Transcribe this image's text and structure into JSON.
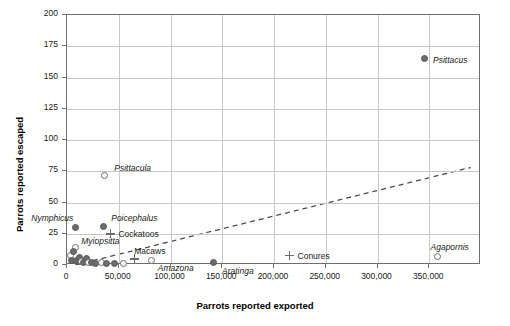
{
  "chart_data": {
    "type": "scatter",
    "title": "",
    "xlabel": "Parrots reported exported",
    "ylabel": "Parrots reported escaped",
    "xlim": [
      0,
      400000
    ],
    "ylim": [
      0,
      200
    ],
    "grid": true,
    "legend": "none",
    "xticks": [
      0,
      50000,
      100000,
      150000,
      200000,
      250000,
      300000,
      350000
    ],
    "xticklabels": [
      "0",
      "50,000",
      "100,000",
      "150,000",
      "200,000",
      "250,000",
      "300,000",
      "350,000"
    ],
    "yticks": [
      0,
      25,
      50,
      75,
      100,
      125,
      150,
      175,
      200
    ],
    "yticklabels": [
      "0",
      "25",
      "50",
      "75",
      "100",
      "125",
      "150",
      "175",
      "200"
    ],
    "trendline": {
      "x0": 8000,
      "y0": 0,
      "x1": 390000,
      "y1": 78,
      "style": "dashed"
    },
    "points": [
      {
        "label": "Psittacus",
        "x": 345000,
        "y": 165,
        "marker": "filled",
        "label_dx": 9,
        "label_dy": -4
      },
      {
        "label": "Psittacula",
        "x": 36000,
        "y": 72,
        "marker": "open",
        "label_dx": 10,
        "label_dy": -12
      },
      {
        "label": "Nymphicus",
        "x": 8000,
        "y": 30,
        "marker": "filled",
        "label_dx": -44,
        "label_dy": -15
      },
      {
        "label": "Poicephalus",
        "x": 35000,
        "y": 31,
        "marker": "filled",
        "label_dx": 8,
        "label_dy": -13
      },
      {
        "label": "Cockatoos",
        "x": 42000,
        "y": 25,
        "marker": "cross",
        "label_dx": 8,
        "label_dy": -5
      },
      {
        "label": "Myiopsitta",
        "x": 8000,
        "y": 14,
        "marker": "open",
        "label_dx": 6,
        "label_dy": -12
      },
      {
        "label": "Macaws",
        "x": 65000,
        "y": 5,
        "marker": "cross",
        "label_dx": 0,
        "label_dy": -13
      },
      {
        "label": "Amazona",
        "x": 82000,
        "y": 4,
        "marker": "open",
        "label_dx": 6,
        "label_dy": 3
      },
      {
        "label": "Aratinga",
        "x": 142000,
        "y": 2,
        "marker": "filled",
        "label_dx": 8,
        "label_dy": 3
      },
      {
        "label": "Conures",
        "x": 215000,
        "y": 8,
        "marker": "cross",
        "label_dx": 8,
        "label_dy": -4
      },
      {
        "label": "Agapornis",
        "x": 358000,
        "y": 7,
        "marker": "open",
        "label_dx": -7,
        "label_dy": -14
      },
      {
        "label": "",
        "x": 3000,
        "y": 8,
        "marker": "open"
      },
      {
        "label": "",
        "x": 4500,
        "y": 4,
        "marker": "filled"
      },
      {
        "label": "",
        "x": 9000,
        "y": 4,
        "marker": "filled"
      },
      {
        "label": "",
        "x": 12000,
        "y": 6,
        "marker": "filled"
      },
      {
        "label": "",
        "x": 14000,
        "y": 3,
        "marker": "open"
      },
      {
        "label": "",
        "x": 16000,
        "y": 2,
        "marker": "filled"
      },
      {
        "label": "",
        "x": 19000,
        "y": 5,
        "marker": "filled"
      },
      {
        "label": "",
        "x": 21000,
        "y": 2,
        "marker": "open"
      },
      {
        "label": "",
        "x": 24000,
        "y": 2,
        "marker": "filled"
      },
      {
        "label": "",
        "x": 28000,
        "y": 1,
        "marker": "filled"
      },
      {
        "label": "",
        "x": 33000,
        "y": 2,
        "marker": "open"
      },
      {
        "label": "",
        "x": 38000,
        "y": 1,
        "marker": "filled"
      },
      {
        "label": "",
        "x": 46000,
        "y": 1,
        "marker": "filled"
      },
      {
        "label": "",
        "x": 55000,
        "y": 1,
        "marker": "open"
      },
      {
        "label": "",
        "x": 6500,
        "y": 11,
        "marker": "filled"
      }
    ]
  }
}
